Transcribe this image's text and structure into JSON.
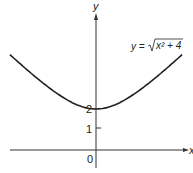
{
  "chart_data": {
    "type": "line",
    "title": "",
    "equation_label": {
      "lhs": "y =",
      "radicand": "x² + 4"
    },
    "xlabel": "x",
    "ylabel": "y",
    "y_ticks": [
      {
        "value": 1,
        "label": "1"
      },
      {
        "value": 2,
        "label": "2"
      }
    ],
    "origin_label": "0",
    "xlim": [
      -4.2,
      4.2
    ],
    "ylim": [
      -1,
      7
    ],
    "grid": false,
    "legend": null,
    "series": [
      {
        "name": "y = sqrt(x^2 + 4)",
        "x": [
          -4.2,
          -3.5,
          -3,
          -2.5,
          -2,
          -1.5,
          -1,
          -0.5,
          0,
          0.5,
          1,
          1.5,
          2,
          2.5,
          3,
          3.5,
          4.2
        ],
        "values": [
          4.65,
          4.03,
          3.61,
          3.2,
          2.83,
          2.5,
          2.24,
          2.06,
          2.0,
          2.06,
          2.24,
          2.5,
          2.83,
          3.2,
          3.61,
          4.03,
          4.65
        ]
      }
    ]
  }
}
